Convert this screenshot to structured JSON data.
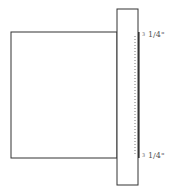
{
  "diagram": {
    "type": "technical-drawing",
    "colors": {
      "stroke": "#333333",
      "dotted": "#777777",
      "label": "#555555",
      "background": "#ffffff"
    },
    "shapes": {
      "cabinet_box": {
        "x": 11,
        "y": 32,
        "w": 106,
        "h": 126
      },
      "face_frame": {
        "x": 117,
        "y": 9,
        "w": 21,
        "h": 176
      },
      "overlay_strip": {
        "x": 138,
        "y": 32,
        "w": 1.5,
        "h": 126
      },
      "hidden_line_x": 135
    },
    "annotations": {
      "top": {
        "marker": "3",
        "value": "1/4\""
      },
      "bottom": {
        "marker": "3",
        "value": "1/4\""
      }
    }
  }
}
